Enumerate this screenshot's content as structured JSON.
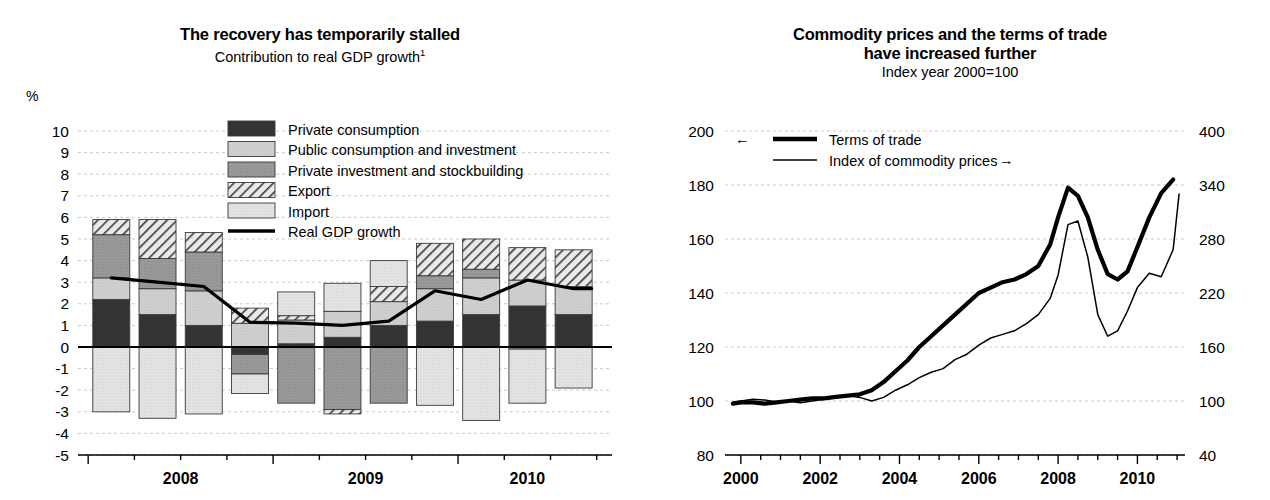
{
  "left_panel": {
    "title": "The recovery has temporarily stalled",
    "subtitle": "Contribution to real GDP growth",
    "subtitle_footnote": "1",
    "unit_label": "%",
    "legend": [
      {
        "label": "Private consumption",
        "swatch": "dark-solid"
      },
      {
        "label": "Public consumption and investment",
        "swatch": "light-gray"
      },
      {
        "label": "Private investment and stockbuilding",
        "swatch": "mid-gray"
      },
      {
        "label": "Export",
        "swatch": "hatched"
      },
      {
        "label": "Import",
        "swatch": "pale-gray"
      },
      {
        "label": "Real GDP growth",
        "swatch": "black-line"
      }
    ]
  },
  "right_panel": {
    "title_line1": "Commodity prices and the terms of trade",
    "title_line2": "have increased further",
    "subtitle": "Index year 2000=100",
    "legend": [
      {
        "label": "Terms of trade",
        "swatch": "thick-line",
        "arrow": "←",
        "arrow_side": "left",
        "axis": "left"
      },
      {
        "label": "Index of commodity prices",
        "swatch": "thin-line",
        "arrow": "→",
        "arrow_side": "right",
        "axis": "right"
      }
    ]
  },
  "chart_data": [
    {
      "id": "gdp-contribution",
      "type": "bar",
      "stacked": true,
      "title": "The recovery has temporarily stalled",
      "subtitle": "Contribution to real GDP growth 1",
      "xlabel": "",
      "ylabel": "%",
      "ylim": [
        -5,
        10
      ],
      "ytick_labels": [
        "10",
        "9",
        "8",
        "7",
        "6",
        "5",
        "4",
        "3",
        "2",
        "1",
        "0",
        "-1",
        "-2",
        "-3",
        "-4",
        "-5"
      ],
      "yticks": [
        10,
        9,
        8,
        7,
        6,
        5,
        4,
        3,
        2,
        1,
        0,
        -1,
        -2,
        -3,
        -4,
        -5
      ],
      "grid": true,
      "legend_position": "inside-top-center",
      "categories": [
        "2008Q1",
        "2008Q2",
        "2008Q3",
        "2008Q4",
        "2009Q1",
        "2009Q2",
        "2009Q3",
        "2009Q4",
        "2010Q1",
        "2010Q2",
        "2010Q3"
      ],
      "xtick_year_labels": [
        "2008",
        "2009",
        "2010"
      ],
      "series": [
        {
          "name": "Private consumption",
          "values": [
            2.2,
            1.5,
            1.0,
            -0.35,
            0.15,
            0.45,
            1.0,
            1.2,
            1.5,
            1.9,
            1.5
          ]
        },
        {
          "name": "Public consumption and investment",
          "values": [
            1.0,
            1.2,
            1.6,
            1.1,
            1.1,
            1.2,
            1.1,
            1.5,
            1.7,
            1.2,
            1.3
          ]
        },
        {
          "name": "Private investment and stockbuilding",
          "values": [
            2.0,
            1.4,
            1.8,
            -0.9,
            -2.6,
            -2.9,
            -2.6,
            0.6,
            0.4,
            -0.1,
            0.0
          ]
        },
        {
          "name": "Export",
          "values": [
            0.7,
            1.8,
            0.9,
            0.7,
            0.2,
            -0.2,
            0.7,
            1.5,
            1.4,
            1.5,
            1.7
          ]
        },
        {
          "name": "Import",
          "values": [
            -3.0,
            -3.3,
            -3.1,
            -0.9,
            1.1,
            1.3,
            1.2,
            -2.7,
            -3.4,
            -2.5,
            -1.9
          ]
        }
      ],
      "line_series": {
        "name": "Real GDP growth",
        "values": [
          3.2,
          3.0,
          2.8,
          1.15,
          1.1,
          1.0,
          1.2,
          2.6,
          2.2,
          3.1,
          2.7
        ]
      }
    },
    {
      "id": "terms-of-trade-commodity-prices",
      "type": "line",
      "title": "Commodity prices and the terms of trade have increased further",
      "subtitle": "Index year 2000=100",
      "xlabel": "",
      "grid": true,
      "legend_position": "inside-top-left",
      "xlim": [
        1999.6,
        2011.2
      ],
      "xtick_labels": [
        "2000",
        "2002",
        "2004",
        "2006",
        "2008",
        "2010"
      ],
      "xticks": [
        2000,
        2002,
        2004,
        2006,
        2008,
        2010
      ],
      "left_axis": {
        "label": "Terms of trade",
        "ylim": [
          80,
          200
        ],
        "yticks": [
          80,
          100,
          120,
          140,
          160,
          180,
          200
        ]
      },
      "right_axis": {
        "label": "Index of commodity prices",
        "ylim": [
          40,
          400
        ],
        "yticks": [
          40,
          100,
          160,
          220,
          280,
          340,
          400
        ]
      },
      "series": [
        {
          "name": "Terms of trade",
          "axis": "left",
          "x": [
            1999.8,
            2000.0,
            2000.3,
            2000.6,
            2000.9,
            2001.2,
            2001.5,
            2001.8,
            2002.1,
            2002.4,
            2002.7,
            2003.0,
            2003.3,
            2003.6,
            2003.9,
            2004.2,
            2004.5,
            2004.8,
            2005.1,
            2005.4,
            2005.7,
            2006.0,
            2006.3,
            2006.6,
            2006.9,
            2007.2,
            2007.5,
            2007.8,
            2008.0,
            2008.25,
            2008.5,
            2008.75,
            2009.0,
            2009.25,
            2009.5,
            2009.75,
            2010.0,
            2010.3,
            2010.6,
            2010.9
          ],
          "y": [
            99,
            99.5,
            99.5,
            99,
            99.5,
            100,
            100.5,
            101,
            101,
            101.5,
            102,
            102.5,
            104,
            107,
            111,
            115,
            120,
            124,
            128,
            132,
            136,
            140,
            142,
            144,
            145,
            147,
            150,
            158,
            168,
            179,
            176,
            168,
            156,
            147,
            145,
            148,
            157,
            168,
            177,
            182
          ]
        },
        {
          "name": "Index of commodity prices",
          "axis": "right",
          "x": [
            1999.8,
            2000.0,
            2000.3,
            2000.6,
            2000.9,
            2001.2,
            2001.5,
            2001.8,
            2002.1,
            2002.4,
            2002.7,
            2003.0,
            2003.3,
            2003.6,
            2003.9,
            2004.2,
            2004.5,
            2004.8,
            2005.1,
            2005.4,
            2005.7,
            2006.0,
            2006.3,
            2006.6,
            2006.9,
            2007.2,
            2007.5,
            2007.8,
            2008.0,
            2008.25,
            2008.5,
            2008.75,
            2009.0,
            2009.25,
            2009.5,
            2009.75,
            2010.0,
            2010.3,
            2010.6,
            2010.9,
            2011.05
          ],
          "y": [
            99,
            100,
            102,
            101,
            99,
            100,
            98,
            100,
            102,
            104,
            106,
            104,
            100,
            104,
            112,
            118,
            126,
            132,
            136,
            146,
            152,
            162,
            170,
            174,
            178,
            186,
            196,
            214,
            240,
            296,
            300,
            260,
            196,
            172,
            178,
            200,
            226,
            242,
            238,
            268,
            330
          ]
        }
      ]
    }
  ]
}
